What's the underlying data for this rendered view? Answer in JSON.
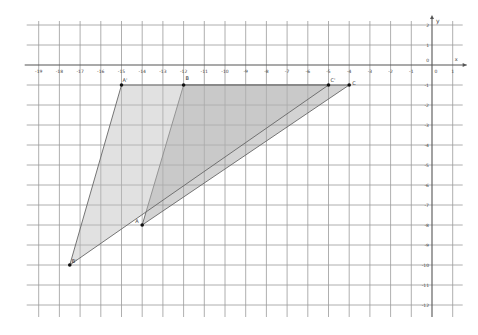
{
  "canvas": {
    "width": 478,
    "height": 335,
    "background": "#ffffff"
  },
  "grid": {
    "origin_px": [
      432,
      65
    ],
    "unit_x_px": 20.7,
    "unit_y_px": 20.0,
    "x_min": -19,
    "x_max": 1,
    "y_min": -12,
    "y_max": 2,
    "line_color": "#9a9a9a",
    "axis_color": "#555555"
  },
  "axes": {
    "x_label": "x",
    "y_label": "y",
    "origin_label": "0",
    "x_ticks": [
      "-19",
      "-18",
      "-17",
      "-16",
      "-15",
      "-14",
      "-13",
      "-12",
      "-11",
      "-10",
      "-9",
      "-8",
      "-7",
      "-6",
      "-5",
      "-4",
      "-3",
      "-2",
      "-1",
      "1"
    ],
    "y_ticks": [
      "2",
      "1",
      "-1",
      "-2",
      "-3",
      "-4",
      "-5",
      "-6",
      "-7",
      "-8",
      "-9",
      "-10",
      "-11",
      "-12"
    ]
  },
  "shapes": [
    {
      "name": "triangle-ABC",
      "vertices": [
        {
          "label": "A",
          "x": -14,
          "y": -8
        },
        {
          "label": "B",
          "x": -12,
          "y": -1
        },
        {
          "label": "C",
          "x": -4,
          "y": -1
        }
      ],
      "fill": "#9e9e9e",
      "fill_opacity": 0.45,
      "stroke": "#666666"
    },
    {
      "name": "triangle-A'B'C'",
      "vertices": [
        {
          "label": "A'",
          "x": -15,
          "y": -1
        },
        {
          "label": "B'",
          "x": -17.5,
          "y": -10
        },
        {
          "label": "C'",
          "x": -5,
          "y": -1
        }
      ],
      "fill": "#bdbdbd",
      "fill_opacity": 0.45,
      "stroke": "#666666"
    }
  ],
  "points": [
    {
      "label": "A",
      "x": -14,
      "y": -8,
      "dx": -7,
      "dy": -2
    },
    {
      "label": "B",
      "x": -12,
      "y": -1,
      "dx": 2,
      "dy": -5
    },
    {
      "label": "C",
      "x": -4,
      "y": -1,
      "dx": 3,
      "dy": 0
    },
    {
      "label": "A'",
      "x": -15,
      "y": -1,
      "dx": 1,
      "dy": -3
    },
    {
      "label": "B'",
      "x": -17.5,
      "y": -10,
      "dx": 2,
      "dy": -2
    },
    {
      "label": "C'",
      "x": -5,
      "y": -1,
      "dx": 2,
      "dy": -3
    }
  ]
}
